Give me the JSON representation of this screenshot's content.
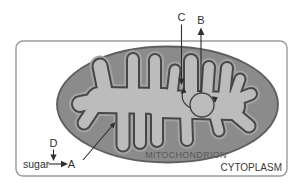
{
  "diagram": {
    "labels": {
      "a": "A",
      "b": "B",
      "c": "C",
      "d": "D",
      "sugar": "sugar",
      "mitochondrion": "MITOCHONDRION",
      "cytoplasm": "CYTOPLASM"
    }
  },
  "colors": {
    "background": "#ffffff",
    "cell_border": "#9a9a9a",
    "outer_compartment": "#8b8b8b",
    "outer_outline": "#5e5e5e",
    "matrix": "#bcbcbc",
    "inner_membrane": "#474747",
    "membrane_halo": "#a4a4a4",
    "line": "#2f2f2f",
    "organelle_label": "#5a5a5a",
    "region_label": "#3a3a3a"
  }
}
